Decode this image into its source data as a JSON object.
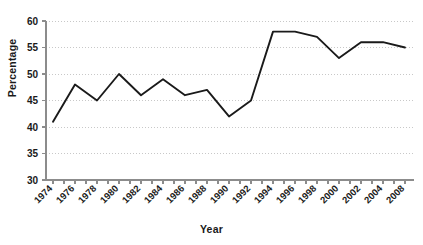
{
  "chart_data": {
    "type": "line",
    "title": "",
    "subtitle": "",
    "xlabel": "Year",
    "ylabel": "Percentage",
    "categories": [
      "1974",
      "1976",
      "1978",
      "1980",
      "1982",
      "1984",
      "1986",
      "1988",
      "1990",
      "1992",
      "1994",
      "1996",
      "1998",
      "2000",
      "2002",
      "2004",
      "2008"
    ],
    "values": [
      41,
      48,
      45,
      50,
      46,
      49,
      46,
      47,
      42,
      45,
      58,
      58,
      57,
      53,
      56,
      56,
      55
    ],
    "series": [
      {
        "name": "Percentage",
        "values": [
          41,
          48,
          45,
          50,
          46,
          49,
          46,
          47,
          42,
          45,
          58,
          58,
          57,
          53,
          56,
          56,
          55
        ]
      }
    ],
    "ylim": [
      30,
      60
    ],
    "yticks": [
      30,
      35,
      40,
      45,
      50,
      55,
      60
    ],
    "ytick_labels": [
      "30",
      "35",
      "40",
      "45",
      "50",
      "55",
      "60"
    ],
    "grid": true,
    "grid_style": "dotted-horizontal",
    "legend": false,
    "legend_position": "none",
    "line_color": "#1a1a1a",
    "grid_color": "#c8c8c8",
    "axis_color": "#8c8c8c",
    "background_color": "#ffffff",
    "xtick_label_rotation": -45,
    "minor_xticks_per_category": 2
  },
  "axes": {
    "y_title": "Percentage",
    "x_title": "Year"
  }
}
